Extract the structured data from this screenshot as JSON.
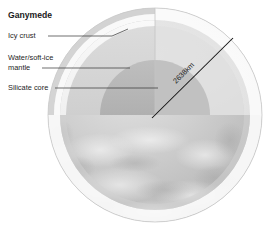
{
  "figure": {
    "title": "Ganymede",
    "background_color": "#ffffff",
    "width": 265,
    "height": 235
  },
  "labels": [
    {
      "id": "icy-crust",
      "line1": "Icy crust",
      "line2": "",
      "leader": "horizontal"
    },
    {
      "id": "water-soft-ice-mantle",
      "line1": "Water/soft-ice",
      "line2": "mantle",
      "leader": "horizontal"
    },
    {
      "id": "silicate-core",
      "line1": "Silicate core",
      "line2": "",
      "leader": "horizontal"
    }
  ],
  "dimension": {
    "value": "2638km",
    "measures": "diameter",
    "orientation": "diagonal"
  },
  "layers": {
    "crust_name": "Icy crust",
    "mantle_name": "Water/soft-ice mantle",
    "core_name": "Silicate core",
    "surface_color": "#bdbdbd",
    "crust_color": "#fbfbfb",
    "mantle_color": "#dcdcdc",
    "core_color": "#b4b4b4",
    "outline_color": "#c9c9c9"
  }
}
